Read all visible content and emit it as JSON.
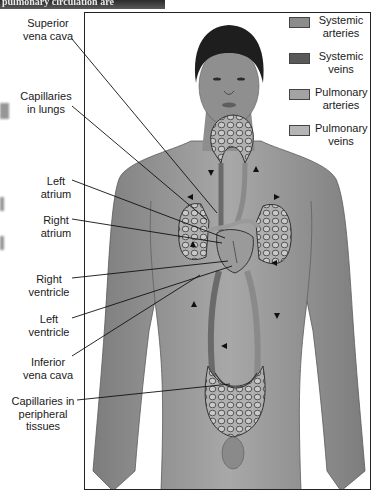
{
  "header": {
    "title_fragment": "pulmonary circulation are"
  },
  "legend": {
    "items": [
      {
        "label_line1": "Systemic",
        "label_line2": "arteries",
        "color": "#8c8c8c"
      },
      {
        "label_line1": "Systemic",
        "label_line2": "veins",
        "color": "#595959"
      },
      {
        "label_line1": "Pulmonary",
        "label_line2": "arteries",
        "color": "#a3a3a3"
      },
      {
        "label_line1": "Pulmonary",
        "label_line2": "veins",
        "color": "#b5b5b5"
      }
    ]
  },
  "labels": {
    "superior_vena_cava": {
      "line1": "Superior",
      "line2": "vena cava"
    },
    "capillaries_lungs": {
      "line1": "Capillaries",
      "line2": "in lungs"
    },
    "left_atrium": {
      "line1": "Left",
      "line2": "atrium"
    },
    "right_atrium": {
      "line1": "Right",
      "line2": "atrium"
    },
    "right_ventricle": {
      "line1": "Right",
      "line2": "ventricle"
    },
    "left_ventricle": {
      "line1": "Left",
      "line2": "ventricle"
    },
    "inferior_vena_cava": {
      "line1": "Inferior",
      "line2": "vena cava"
    },
    "capillaries_peripheral": {
      "line1": "Capillaries in",
      "line2": "peripheral",
      "line3": "tissues"
    }
  },
  "colors": {
    "skin": "#9a9a9a",
    "skin_dark": "#7a7a7a",
    "hair": "#1e1e1e",
    "vessel": "#8a8a8a",
    "vessel_outline": "#333333",
    "frame": "#222222"
  }
}
